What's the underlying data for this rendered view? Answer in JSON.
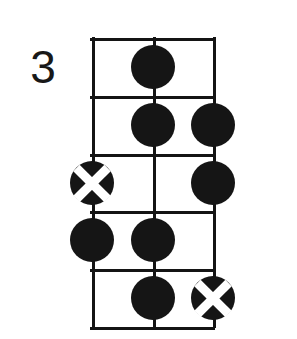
{
  "diagram": {
    "type": "chord-diagram",
    "instrument_strings": 3,
    "position_label": "3",
    "fret_count": 5,
    "string_count": 3,
    "geometry": {
      "grid_left": 92,
      "grid_top": 38,
      "grid_width": 121,
      "grid_height": 289,
      "fret_spacing": 57.8,
      "string_spacing": 60.5,
      "marker_radius": 22
    },
    "colors": {
      "ink": "#141414",
      "marker_fill": "#151515",
      "background": "#ffffff",
      "x_stroke": "#ffffff",
      "label_color": "#181818"
    },
    "strings": [
      {
        "index": 0,
        "name": "string-left"
      },
      {
        "index": 1,
        "name": "string-middle"
      },
      {
        "index": 2,
        "name": "string-right"
      }
    ],
    "frets": [
      {
        "index": 1,
        "name": "fret-1"
      },
      {
        "index": 2,
        "name": "fret-2"
      },
      {
        "index": 3,
        "name": "fret-3"
      },
      {
        "index": 4,
        "name": "fret-4"
      },
      {
        "index": 5,
        "name": "fret-5"
      }
    ],
    "markers": [
      {
        "id": "marker-f1-s1",
        "string": 1,
        "fret": 1,
        "kind": "dot",
        "label": "filled-dot"
      },
      {
        "id": "marker-f2-s1",
        "string": 1,
        "fret": 2,
        "kind": "dot",
        "label": "filled-dot"
      },
      {
        "id": "marker-f2-s2",
        "string": 2,
        "fret": 2,
        "kind": "dot",
        "label": "filled-dot"
      },
      {
        "id": "marker-f3-s0",
        "string": 0,
        "fret": 3,
        "kind": "muted",
        "label": "x-marker"
      },
      {
        "id": "marker-f3-s2",
        "string": 2,
        "fret": 3,
        "kind": "dot",
        "label": "filled-dot"
      },
      {
        "id": "marker-f4-s0",
        "string": 0,
        "fret": 4,
        "kind": "dot",
        "label": "filled-dot"
      },
      {
        "id": "marker-f4-s1",
        "string": 1,
        "fret": 4,
        "kind": "dot",
        "label": "filled-dot"
      },
      {
        "id": "marker-f5-s1",
        "string": 1,
        "fret": 5,
        "kind": "dot",
        "label": "filled-dot"
      },
      {
        "id": "marker-f5-s2",
        "string": 2,
        "fret": 5,
        "kind": "muted",
        "label": "x-marker"
      }
    ]
  }
}
